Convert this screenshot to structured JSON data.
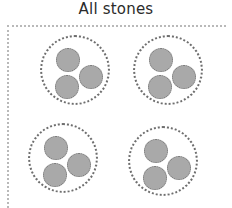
{
  "title": "All stones",
  "colors": {
    "background": "#ffffff",
    "title_text": "#2b2b2b",
    "frame_dots": "#b9b9b9",
    "group_outline": "#6e6e6e",
    "stone_fill": "#a9a9a9",
    "stone_outline": "#747474"
  },
  "frame": {
    "name": "worksheet-frame",
    "style": "dotted",
    "edges_visible": [
      "top",
      "left"
    ],
    "x": 7,
    "y": 25,
    "width": 219,
    "height": 183
  },
  "counts": {
    "groups": 4,
    "stones_per_group": 3,
    "total_stones": 12
  },
  "chart_data": {
    "type": "diagram",
    "title": "All stones",
    "categories": [
      "Group 1",
      "Group 2",
      "Group 3",
      "Group 4"
    ],
    "values": [
      3,
      3,
      3,
      3
    ],
    "total": 12
  },
  "groups": [
    {
      "label": "Group 1",
      "cx": 75,
      "cy": 70,
      "r": 35,
      "stones": [
        {
          "label": "Stone 1",
          "cx": 66,
          "cy": 58,
          "r": 12
        },
        {
          "label": "Stone 2",
          "cx": 89,
          "cy": 75,
          "r": 12
        },
        {
          "label": "Stone 3",
          "cx": 65,
          "cy": 85,
          "r": 12
        }
      ]
    },
    {
      "label": "Group 2",
      "cx": 168,
      "cy": 70,
      "r": 35,
      "stones": [
        {
          "label": "Stone 1",
          "cx": 159,
          "cy": 58,
          "r": 12
        },
        {
          "label": "Stone 2",
          "cx": 182,
          "cy": 75,
          "r": 12
        },
        {
          "label": "Stone 3",
          "cx": 158,
          "cy": 85,
          "r": 12
        }
      ]
    },
    {
      "label": "Group 3",
      "cx": 63,
      "cy": 158,
      "r": 35,
      "stones": [
        {
          "label": "Stone 1",
          "cx": 54,
          "cy": 146,
          "r": 12
        },
        {
          "label": "Stone 2",
          "cx": 77,
          "cy": 163,
          "r": 12
        },
        {
          "label": "Stone 3",
          "cx": 53,
          "cy": 173,
          "r": 12
        }
      ]
    },
    {
      "label": "Group 4",
      "cx": 163,
      "cy": 161,
      "r": 35,
      "stones": [
        {
          "label": "Stone 1",
          "cx": 154,
          "cy": 149,
          "r": 12
        },
        {
          "label": "Stone 2",
          "cx": 177,
          "cy": 166,
          "r": 12
        },
        {
          "label": "Stone 3",
          "cx": 153,
          "cy": 176,
          "r": 12
        }
      ]
    }
  ]
}
